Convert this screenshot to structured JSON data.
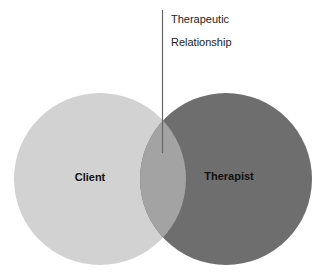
{
  "diagram": {
    "type": "venn",
    "sets": [
      {
        "label": "Client",
        "color": "#d2d2d2"
      },
      {
        "label": "Therapist",
        "color": "#6e6e6e"
      }
    ],
    "intersection": {
      "color": "#a3a3a3"
    },
    "callout": {
      "line1": "Therapeutic",
      "line2": "Relationship",
      "line_color": "#666666"
    }
  }
}
